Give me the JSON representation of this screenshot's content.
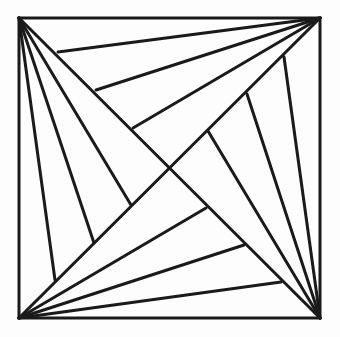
{
  "diagram": {
    "title": "",
    "background": "#fdfdfd",
    "stroke_color": "#1a1a1a",
    "square": {
      "x1": 19,
      "y1": 18,
      "x2": 320,
      "y2": 318
    },
    "diagonals": [
      {
        "name": "diagonal-tl-br",
        "from": [
          19,
          18
        ],
        "to": [
          320,
          318
        ]
      },
      {
        "name": "diagonal-bl-tr",
        "from": [
          19,
          318
        ],
        "to": [
          320,
          18
        ]
      }
    ],
    "fans": [
      {
        "name": "fan-top-left",
        "origin": [
          19,
          18
        ],
        "targets": [
          [
            55,
            280
          ],
          [
            94,
            243
          ],
          [
            131,
            205
          ]
        ]
      },
      {
        "name": "fan-top-right",
        "origin": [
          320,
          18
        ],
        "targets": [
          [
            58,
            52
          ],
          [
            96,
            90
          ],
          [
            133,
            128
          ]
        ]
      },
      {
        "name": "fan-bottom-right",
        "origin": [
          320,
          318
        ],
        "targets": [
          [
            284,
            57
          ],
          [
            247,
            94
          ],
          [
            208,
            131
          ]
        ]
      },
      {
        "name": "fan-bottom-left",
        "origin": [
          19,
          318
        ],
        "targets": [
          [
            206,
            208
          ],
          [
            244,
            245
          ],
          [
            281,
            282
          ]
        ]
      }
    ]
  }
}
